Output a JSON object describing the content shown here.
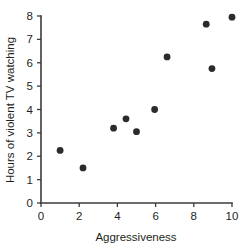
{
  "chart_data": {
    "type": "scatter",
    "title": "",
    "xlabel": "Aggressiveness",
    "ylabel": "Hours of violent TV watching",
    "xlim": [
      0,
      10
    ],
    "ylim": [
      0,
      8
    ],
    "xticks": [
      0,
      2,
      4,
      6,
      8,
      10
    ],
    "yticks": [
      0,
      1,
      2,
      3,
      4,
      5,
      6,
      7,
      8
    ],
    "xtick_labels": [
      "0",
      "2",
      "4",
      "6",
      "8",
      "10"
    ],
    "ytick_labels": [
      "0",
      "1",
      "2",
      "3",
      "4",
      "5",
      "6",
      "7",
      "8"
    ],
    "grid": false,
    "legend": false,
    "marker": "filled-circle",
    "marker_color": "#2b2b2b",
    "axis_color": "#3b3b3b",
    "series": [
      {
        "name": "observations",
        "points": [
          {
            "x": 1.0,
            "y": 2.25
          },
          {
            "x": 2.2,
            "y": 1.5
          },
          {
            "x": 3.8,
            "y": 3.2
          },
          {
            "x": 4.45,
            "y": 3.6
          },
          {
            "x": 5.0,
            "y": 3.05
          },
          {
            "x": 5.95,
            "y": 4.0
          },
          {
            "x": 6.6,
            "y": 6.25
          },
          {
            "x": 8.65,
            "y": 7.65
          },
          {
            "x": 8.95,
            "y": 5.75
          },
          {
            "x": 10.0,
            "y": 7.95
          }
        ]
      }
    ]
  }
}
